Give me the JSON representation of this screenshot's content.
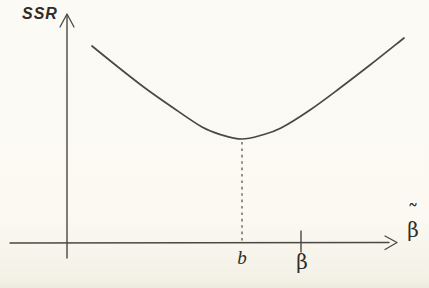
{
  "labels": {
    "y_axis": "SSR",
    "x_axis_base": "β",
    "x_axis_accent": "˜",
    "minimum": "b",
    "tick": "β"
  },
  "colors": {
    "background": "#fbf9f2",
    "ink": "#4a4842",
    "text": "#2e2d29"
  },
  "chart_data": {
    "type": "line",
    "title": "",
    "xlabel": "β̃",
    "ylabel": "SSR",
    "axes_numeric": false,
    "grid": false,
    "legend": false,
    "curve_points_px": [
      [
        92,
        46
      ],
      [
        118,
        67
      ],
      [
        145,
        88
      ],
      [
        172,
        107
      ],
      [
        202,
        127
      ],
      [
        222,
        135
      ],
      [
        242,
        139
      ],
      [
        262,
        135
      ],
      [
        281,
        128
      ],
      [
        310,
        110
      ],
      [
        340,
        88
      ],
      [
        370,
        65
      ],
      [
        404,
        38
      ]
    ],
    "minimum_px": {
      "x": 242,
      "y": 139,
      "label": "b"
    },
    "tick_px": {
      "x": 301,
      "label": "β"
    },
    "axis_px": {
      "origin_x": 67,
      "axis_y": 243,
      "x_start": 10,
      "x_end": 397,
      "y_top": 13,
      "y_bottom": 258
    }
  }
}
